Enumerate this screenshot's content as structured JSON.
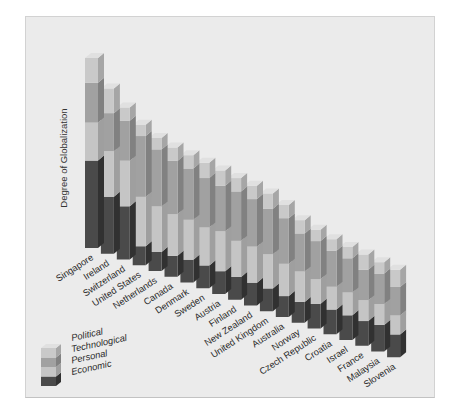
{
  "page": {
    "background": "#ffffff",
    "panel_background": "#ebebeb",
    "panel_border": "#d2d2d2"
  },
  "axis": {
    "y_label": "Degree of Globalization"
  },
  "legend": {
    "position": "bottom-left",
    "items": [
      {
        "label": "Political"
      },
      {
        "label": "Technological"
      },
      {
        "label": "Personal"
      },
      {
        "label": "Economic"
      }
    ]
  },
  "chart_data": {
    "type": "bar",
    "variant": "3d-isometric-stacked",
    "title": "",
    "xlabel": "",
    "ylabel": "Degree of Globalization",
    "axis_numeric_labels": false,
    "grid": false,
    "legend_position": "bottom-left",
    "units": "relative index, estimated from bar heights (Singapore total = 100)",
    "stack_order_bottom_to_top": [
      "Economic",
      "Personal",
      "Technological",
      "Political"
    ],
    "categories": [
      "Singapore",
      "Ireland",
      "Switzerland",
      "United States",
      "Netherlands",
      "Canada",
      "Denmark",
      "Sweden",
      "Austria",
      "Finland",
      "New Zealand",
      "United Kingdom",
      "Australia",
      "Norway",
      "Czech Republic",
      "Croatia",
      "Israel",
      "France",
      "Malaysia",
      "Slovenia"
    ],
    "series": [
      {
        "name": "Economic",
        "values": [
          46,
          30,
          28,
          10,
          10,
          11,
          12,
          12,
          12,
          12,
          12,
          12,
          11,
          11,
          13,
          13,
          13,
          13,
          14,
          12
        ]
      },
      {
        "name": "Personal",
        "values": [
          20,
          24,
          24,
          26,
          24,
          22,
          21,
          20,
          21,
          19,
          19,
          18,
          17,
          16,
          13,
          12,
          12,
          11,
          11,
          10
        ]
      },
      {
        "name": "Technological",
        "values": [
          21,
          20,
          21,
          32,
          30,
          28,
          27,
          26,
          24,
          26,
          25,
          24,
          24,
          20,
          20,
          19,
          18,
          16,
          16,
          15
        ]
      },
      {
        "name": "Political",
        "values": [
          13,
          13,
          7,
          6,
          6,
          7,
          7,
          8,
          8,
          7,
          7,
          8,
          7,
          7,
          6,
          6,
          6,
          8,
          6,
          9
        ]
      }
    ],
    "totals": [
      100,
      87,
      80,
      74,
      70,
      68,
      67,
      66,
      65,
      64,
      63,
      62,
      59,
      54,
      52,
      50,
      49,
      48,
      47,
      46
    ],
    "colors": {
      "Political": {
        "front": "#c9c9c9",
        "side": "#a6a6a6",
        "top": "#e0e0e0"
      },
      "Technological": {
        "front": "#a1a1a1",
        "side": "#818181",
        "top": "#b8b8b8"
      },
      "Personal": {
        "front": "#c5c5c5",
        "side": "#9f9f9f",
        "top": "#d9d9d9"
      },
      "Economic": {
        "front": "#4a4a4a",
        "side": "#313131",
        "top": "#5e5e5e"
      }
    }
  }
}
